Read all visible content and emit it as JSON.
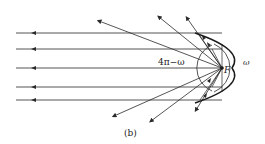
{
  "figure": {
    "caption": "(b)",
    "labels": {
      "solid_angle_outside": "4π−ω",
      "solid_angle_reflector": "ω",
      "focus": "F"
    },
    "colors": {
      "line": "#2a2a2a",
      "background": "#ffffff"
    }
  }
}
